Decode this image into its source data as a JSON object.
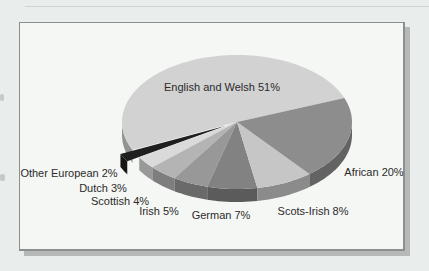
{
  "chart_data": {
    "type": "pie",
    "style": "3d-exploded",
    "title": "",
    "unit": "%",
    "start_angle_deg": 21,
    "direction": "counterclockwise",
    "legend_position": "labels-around-slices",
    "slices": [
      {
        "label": "English and Welsh",
        "value": 51,
        "label_text": "English and Welsh 51%",
        "color": "#d2d2d2",
        "exploded": false,
        "label_x": 222,
        "label_y": 87
      },
      {
        "label": "Other European",
        "value": 2,
        "label_text": "Other European 2%",
        "color": "#1f1f1f",
        "exploded": true,
        "label_x": 69,
        "label_y": 173
      },
      {
        "label": "Dutch",
        "value": 3,
        "label_text": "Dutch 3%",
        "color": "#dadada",
        "exploded": false,
        "label_x": 103,
        "label_y": 188
      },
      {
        "label": "Scottish",
        "value": 4,
        "label_text": "Scottish 4%",
        "color": "#b4b4b4",
        "exploded": false,
        "label_x": 120,
        "label_y": 201
      },
      {
        "label": "Irish",
        "value": 5,
        "label_text": "Irish 5%",
        "color": "#989898",
        "exploded": false,
        "label_x": 159,
        "label_y": 211
      },
      {
        "label": "German",
        "value": 7,
        "label_text": "German 7%",
        "color": "#828282",
        "exploded": false,
        "label_x": 221,
        "label_y": 215
      },
      {
        "label": "Scots-Irish",
        "value": 8,
        "label_text": "Scots-Irish 8%",
        "color": "#c6c6c6",
        "exploded": false,
        "label_x": 313,
        "label_y": 211
      },
      {
        "label": "African",
        "value": 20,
        "label_text": "African 20%",
        "color": "#8d8d8d",
        "exploded": false,
        "label_x": 374,
        "label_y": 172
      }
    ],
    "colors_note": {
      "panel_background": "#f5f7f4",
      "page_background": "#e9edec",
      "panel_border": "#8a8f8f",
      "panel_shadow": "#b6b9b8",
      "label_text_color": "#2b2b2b"
    }
  }
}
